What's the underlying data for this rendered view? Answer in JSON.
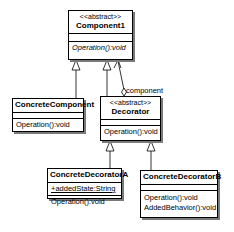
{
  "diagram": {
    "type": "UML class diagram",
    "pattern": "Decorator"
  },
  "classes": {
    "component1": {
      "stereotype": "<<abstract>>",
      "name": "Component1",
      "attributes": [],
      "operations": [
        "Operation():void"
      ]
    },
    "concrete_component": {
      "name": "ConcreteComponent",
      "operations": [
        "Operation():void"
      ]
    },
    "decorator": {
      "stereotype": "<<abstract>>",
      "name": "Decorator",
      "operations": [
        "Operation():void"
      ]
    },
    "concrete_decorator_a": {
      "name": "ConcreteDecoratorA",
      "attributes": [
        "+addedState:String"
      ],
      "operations": [
        "Operation():void"
      ]
    },
    "concrete_decorator_b": {
      "name": "ConcreteDecoratorB",
      "operations": [
        "Operation():void",
        "AddedBehavior():void"
      ]
    }
  },
  "relationships": [
    {
      "type": "generalization",
      "from": "ConcreteComponent",
      "to": "Component1"
    },
    {
      "type": "generalization",
      "from": "Decorator",
      "to": "Component1"
    },
    {
      "type": "aggregation",
      "from": "Decorator",
      "to": "Component1",
      "role": "component"
    },
    {
      "type": "generalization",
      "from": "ConcreteDecoratorA",
      "to": "Decorator"
    },
    {
      "type": "generalization",
      "from": "ConcreteDecoratorB",
      "to": "Decorator"
    }
  ],
  "labels": {
    "aggregation_role": "component"
  }
}
